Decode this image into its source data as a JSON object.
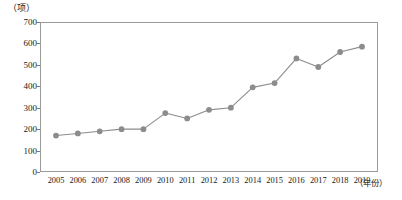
{
  "chart_data": {
    "type": "line",
    "title": "",
    "subtitle": "",
    "xlabel": "（年份）",
    "ylabel": "（项）",
    "categories": [
      "2005",
      "2006",
      "2007",
      "2008",
      "2009",
      "2010",
      "2011",
      "2012",
      "2013",
      "2014",
      "2015",
      "2016",
      "2017",
      "2018",
      "2019"
    ],
    "values": [
      170,
      180,
      190,
      200,
      200,
      275,
      250,
      290,
      300,
      395,
      415,
      530,
      490,
      560,
      585
    ],
    "series": [
      {
        "name": "项目数",
        "values": [
          170,
          180,
          190,
          200,
          200,
          275,
          250,
          290,
          300,
          395,
          415,
          530,
          490,
          560,
          585
        ]
      }
    ],
    "ylim": [
      0,
      700
    ],
    "ytick_step": 100,
    "yticks": [
      "0",
      "100",
      "200",
      "300",
      "400",
      "500",
      "600",
      "700"
    ],
    "xlim_categories": [
      "2005",
      "2019"
    ],
    "grid": false,
    "legend": false,
    "legend_position": "none",
    "marker": "circle",
    "line_color": "#8c8c8c",
    "marker_color": "#8c8c8c",
    "axis_color": "#9a9a9a",
    "background_color": "#ffffff",
    "text_color": "#1a1a1a"
  }
}
